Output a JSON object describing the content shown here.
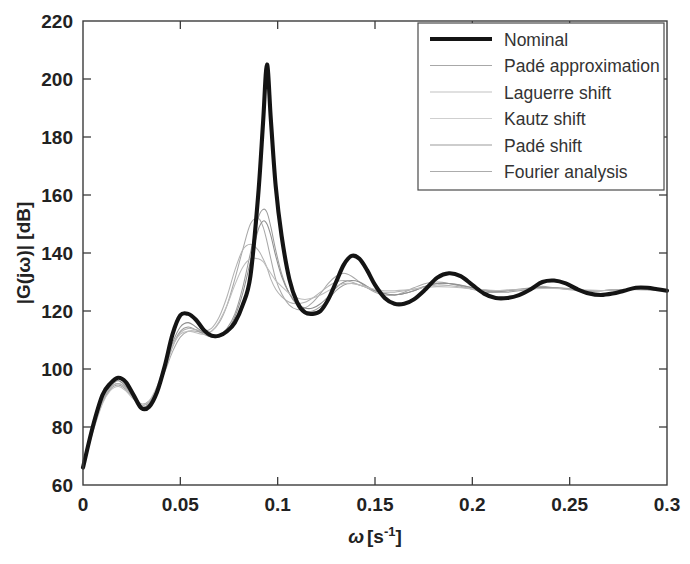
{
  "chart_data": {
    "type": "line",
    "title": "",
    "xlabel": "ω [s⁻¹]",
    "ylabel": "|G(jω)| [dB]",
    "xlim": [
      0,
      0.3
    ],
    "ylim": [
      60,
      220
    ],
    "xticks": [
      0,
      0.05,
      0.1,
      0.15,
      0.2,
      0.25,
      0.3
    ],
    "xtick_labels": [
      "0",
      "0.05",
      "0.1",
      "0.15",
      "0.2",
      "0.25",
      "0.3"
    ],
    "yticks": [
      60,
      80,
      100,
      120,
      140,
      160,
      180,
      200,
      220
    ],
    "ytick_labels": [
      "60",
      "80",
      "100",
      "120",
      "140",
      "160",
      "180",
      "200",
      "220"
    ],
    "grid": false,
    "legend_position": "upper right",
    "x": [
      0.0,
      0.005,
      0.01,
      0.014,
      0.018,
      0.022,
      0.026,
      0.03,
      0.034,
      0.038,
      0.042,
      0.046,
      0.05,
      0.054,
      0.058,
      0.062,
      0.066,
      0.07,
      0.074,
      0.078,
      0.082,
      0.086,
      0.09,
      0.0925,
      0.0945,
      0.0965,
      0.099,
      0.102,
      0.106,
      0.11,
      0.114,
      0.118,
      0.122,
      0.126,
      0.13,
      0.134,
      0.138,
      0.142,
      0.146,
      0.15,
      0.155,
      0.16,
      0.165,
      0.17,
      0.176,
      0.182,
      0.188,
      0.194,
      0.2,
      0.206,
      0.212,
      0.218,
      0.224,
      0.23,
      0.236,
      0.242,
      0.248,
      0.254,
      0.26,
      0.266,
      0.272,
      0.278,
      0.284,
      0.29,
      0.295,
      0.3
    ],
    "series": [
      {
        "name": "Nominal",
        "color": "#141414",
        "width": 4.1,
        "values": [
          66,
          80,
          91,
          95,
          97,
          95.5,
          91,
          86.5,
          87,
          92,
          101,
          112,
          118.5,
          119,
          117,
          113.5,
          111.5,
          111.5,
          113,
          116,
          122,
          132,
          160,
          185,
          205,
          186,
          163,
          146,
          131,
          123,
          119.5,
          119,
          120,
          124,
          130,
          136,
          139,
          138,
          134,
          129,
          124.5,
          122.5,
          122.5,
          124,
          127.5,
          131.5,
          133,
          132,
          129,
          126,
          124.5,
          124.5,
          125.5,
          127.5,
          130,
          130.5,
          129.5,
          127.5,
          126,
          125.5,
          126,
          127,
          128,
          128,
          127.5,
          127
        ]
      },
      {
        "name": "Padé approximation",
        "color": "#a8a8a8",
        "width": 1.05,
        "values": [
          66,
          79,
          89,
          93.5,
          95,
          93.5,
          90.5,
          88,
          89,
          93,
          99,
          106,
          111,
          113,
          113,
          112.5,
          113,
          116,
          122,
          131,
          141,
          150,
          152,
          149,
          144,
          138,
          131,
          126,
          122,
          120.5,
          121,
          123,
          126,
          129.5,
          132,
          133,
          132,
          130,
          128,
          126.5,
          125.5,
          125.5,
          126.5,
          128,
          129.5,
          130,
          129.5,
          128.5,
          127.5,
          126.5,
          126.5,
          127,
          127.5,
          128,
          128.5,
          128,
          127.5,
          127,
          126.8,
          127,
          127.2,
          127.4,
          127.4,
          127.3,
          127.2,
          127
        ]
      },
      {
        "name": "Laguerre shift",
        "color": "#9c9c9c",
        "width": 1.05,
        "values": [
          66,
          78.5,
          88.5,
          93,
          94.5,
          93,
          90,
          87.5,
          88.5,
          93,
          100,
          108,
          113,
          114.5,
          113.5,
          112,
          111,
          111.5,
          114,
          119,
          128,
          140,
          152,
          155,
          154,
          149,
          141,
          133,
          126,
          122,
          120,
          120,
          121.5,
          124,
          127,
          129,
          129.5,
          129,
          128,
          127,
          126,
          125.5,
          126,
          127,
          128.5,
          129.5,
          129.5,
          129,
          128,
          127,
          126.5,
          126.5,
          127,
          127.5,
          128,
          128,
          127.8,
          127.4,
          127,
          127,
          127.2,
          127.4,
          127.5,
          127.4,
          127.2,
          127
        ]
      },
      {
        "name": "Kautz shift",
        "color": "#b2b2b2",
        "width": 1.05,
        "values": [
          66,
          79,
          89,
          93.5,
          95,
          93.5,
          90,
          87,
          88,
          92.5,
          99.5,
          107.5,
          112.5,
          114,
          113.5,
          113,
          114,
          118,
          125,
          134,
          141,
          143,
          141,
          138,
          135,
          131,
          127.5,
          125,
          123,
          122.5,
          123,
          124.5,
          126.5,
          128.5,
          130,
          130.5,
          130,
          129,
          128,
          127,
          126.5,
          126.5,
          127,
          127.5,
          128.5,
          129,
          128.8,
          128.2,
          127.6,
          127.2,
          127,
          127.2,
          127.5,
          127.8,
          128,
          127.9,
          127.6,
          127.3,
          127.1,
          127.1,
          127.2,
          127.3,
          127.4,
          127.3,
          127.1,
          127
        ]
      },
      {
        "name": "Padé shift",
        "color": "#8f8f8f",
        "width": 1.05,
        "values": [
          66,
          79.5,
          90,
          94,
          96,
          94,
          90.5,
          87,
          88,
          93,
          100.5,
          109,
          114.5,
          116,
          114.5,
          112.5,
          111,
          111,
          113,
          118,
          126,
          137,
          148,
          151,
          150,
          146,
          139,
          132,
          126,
          122.5,
          121,
          121,
          122.5,
          125,
          128,
          130,
          130.5,
          130,
          128.5,
          127,
          126,
          125.5,
          126,
          127,
          128.5,
          129.5,
          129.5,
          128.8,
          128,
          127.2,
          126.8,
          127,
          127.4,
          127.8,
          128.1,
          128,
          127.7,
          127.3,
          127,
          127,
          127.2,
          127.4,
          127.5,
          127.4,
          127.2,
          127
        ]
      },
      {
        "name": "Fourier analysis",
        "color": "#bdbdbd",
        "width": 1.05,
        "values": [
          66,
          78,
          88,
          92.5,
          94,
          92.5,
          89.5,
          87.5,
          89,
          94,
          101,
          108,
          112,
          113,
          112.5,
          112,
          113,
          116.5,
          122,
          129,
          135,
          138,
          138,
          137,
          135,
          133,
          130.5,
          128.5,
          126,
          124.5,
          124,
          124.5,
          125.5,
          127,
          128.5,
          129.5,
          129.5,
          129,
          128.2,
          127.5,
          127,
          127,
          127.2,
          127.6,
          128.1,
          128.4,
          128.3,
          128,
          127.6,
          127.3,
          127.1,
          127.2,
          127.4,
          127.6,
          127.8,
          127.8,
          127.6,
          127.4,
          127.2,
          127.1,
          127.2,
          127.3,
          127.3,
          127.3,
          127.1,
          127
        ]
      }
    ],
    "legend": [
      {
        "label": "Nominal",
        "color": "#141414",
        "width": 4.1
      },
      {
        "label": "Padé approximation",
        "color": "#a8a8a8",
        "width": 1.1
      },
      {
        "label": "Laguerre shift",
        "color": "#c2c2c2",
        "width": 1.1
      },
      {
        "label": "Kautz shift",
        "color": "#cfcfcf",
        "width": 1.1
      },
      {
        "label": "Padé shift",
        "color": "#9c9c9c",
        "width": 1.1
      },
      {
        "label": "Fourier analysis",
        "color": "#acacac",
        "width": 1.1
      }
    ]
  },
  "axes": {
    "x_title_symbol": "ω",
    "x_title_unit": "[s",
    "x_title_exp": "-1",
    "x_title_close": "]",
    "y_title": "|G(jω)| [dB]"
  }
}
